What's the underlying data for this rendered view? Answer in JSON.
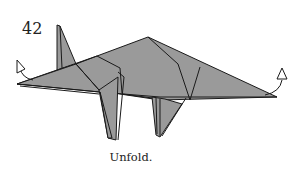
{
  "diagram": {
    "step_number": "42",
    "caption": "Unfold.",
    "fill_color": "#9a9a9a",
    "line_color": "#1a1a1a",
    "arrows": [
      {
        "name": "unfold-arrow-left",
        "position": "head-tip"
      },
      {
        "name": "unfold-arrow-right",
        "position": "tail-tip"
      }
    ]
  }
}
